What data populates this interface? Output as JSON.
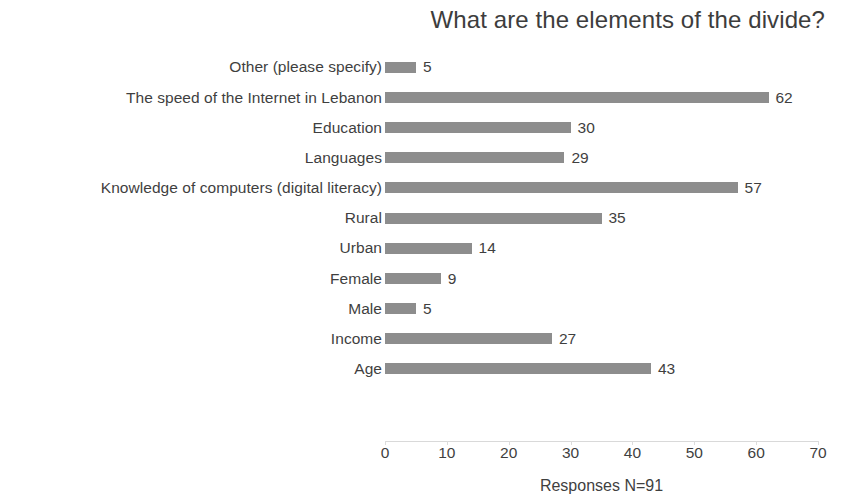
{
  "chart_data": {
    "type": "bar",
    "orientation": "horizontal",
    "title": "What are the elements of the divide?",
    "xlabel": "Responses N=91",
    "ylabel": "",
    "xlim": [
      0,
      70
    ],
    "xticks": [
      0,
      10,
      20,
      30,
      40,
      50,
      60,
      70
    ],
    "grid": false,
    "legend": false,
    "bar_color": "#8d8d8d",
    "text_color": "#3f3f3f",
    "background": "#ffffff",
    "categories": [
      "Other (please specify)",
      "The speed of the Internet in Lebanon",
      "Education",
      "Languages",
      "Knowledge of computers (digital literacy)",
      "Rural",
      "Urban",
      "Female",
      "Male",
      "Income",
      "Age"
    ],
    "values": [
      5,
      62,
      30,
      29,
      57,
      35,
      14,
      9,
      5,
      27,
      43
    ],
    "data_labels": [
      "5",
      "62",
      "30",
      "29",
      "57",
      "35",
      "14",
      "9",
      "5",
      "27",
      "43"
    ]
  }
}
